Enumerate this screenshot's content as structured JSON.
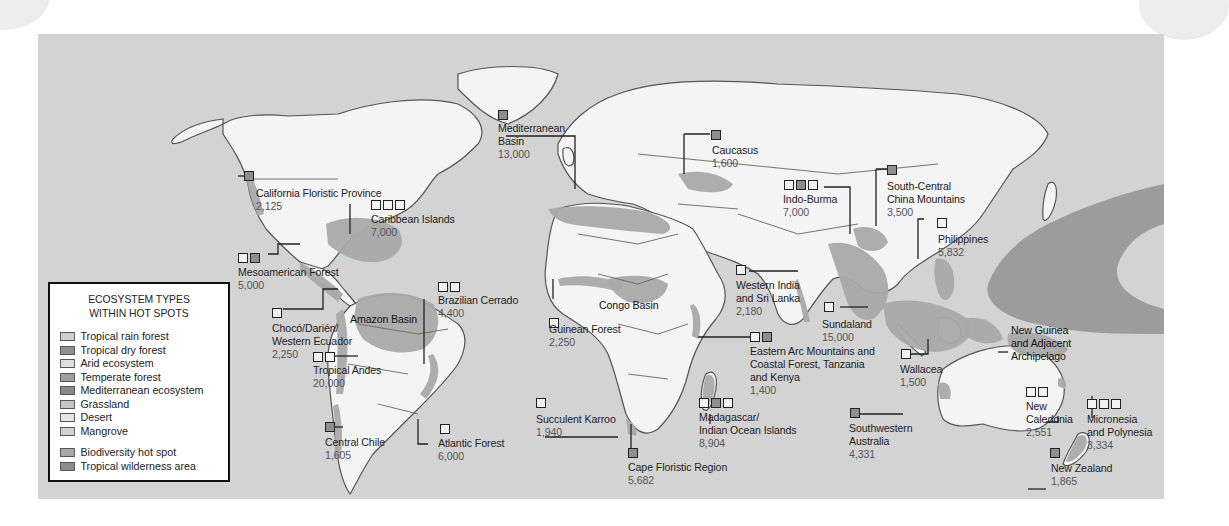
{
  "legend": {
    "title_line1": "ECOSYSTEM TYPES",
    "title_line2": "WITHIN HOT SPOTS",
    "ecosystem_types": [
      {
        "label": "Tropical rain forest",
        "color": "#cfcfcf"
      },
      {
        "label": "Tropical dry forest",
        "color": "#8f8f8f"
      },
      {
        "label": "Arid ecosystem",
        "color": "#dedede"
      },
      {
        "label": "Temperate forest",
        "color": "#a0a0a0"
      },
      {
        "label": "Mediterranean ecosystem",
        "color": "#8a8a8a"
      },
      {
        "label": "Grassland",
        "color": "#c6c6c6"
      },
      {
        "label": "Desert",
        "color": "#e6e6e6"
      },
      {
        "label": "Mangrove",
        "color": "#d2d2d2"
      }
    ],
    "area_types": [
      {
        "label": "Biodiversity hot spot",
        "color": "#a9a9a9"
      },
      {
        "label": "Tropical wilderness area",
        "color": "#8c8c8c"
      }
    ]
  },
  "colors": {
    "ocean": "#d3d3d3",
    "land": "#f4f4f4",
    "hot_spot": "#a9a9a9",
    "wilderness": "#9c9c9c",
    "outline": "#555555"
  },
  "hotspots": [
    {
      "id": "california",
      "name": "California Floristic Province",
      "value": "2,125"
    },
    {
      "id": "caribbean",
      "name": "Caribbean Islands",
      "value": "7,000"
    },
    {
      "id": "mesoamerica",
      "name": "Mesoamerican Forest",
      "value": "5,000"
    },
    {
      "id": "choco",
      "name_line1": "Chocó/Darién/",
      "name_line2": "Western Ecuador",
      "value": "2,250"
    },
    {
      "id": "amazon",
      "name": "Amazon Basin"
    },
    {
      "id": "cerrado",
      "name": "Brazilian Cerrado",
      "value": "4,400"
    },
    {
      "id": "andes",
      "name": "Tropical Andes",
      "value": "20,000"
    },
    {
      "id": "chile",
      "name": "Central Chile",
      "value": "1,605"
    },
    {
      "id": "atlantic",
      "name": "Atlantic Forest",
      "value": "6,000"
    },
    {
      "id": "mediterranean",
      "name_line1": "Mediterranean",
      "name_line2": "Basin",
      "value": "13,000"
    },
    {
      "id": "caucasus",
      "name": "Caucasus",
      "value": "1,600"
    },
    {
      "id": "guinean",
      "name": "Guinean Forest",
      "value": "2,250"
    },
    {
      "id": "congo",
      "name": "Congo Basin"
    },
    {
      "id": "karroo",
      "name": "Succulent Karroo",
      "value": "1,940"
    },
    {
      "id": "cape",
      "name": "Cape Floristic Region",
      "value": "5,682"
    },
    {
      "id": "madagascar",
      "name_line1": "Madagascar/",
      "name_line2": "Indian Ocean Islands",
      "value": "8,904"
    },
    {
      "id": "eastern_arc",
      "name_line1": "Eastern Arc Mountains and",
      "name_line2": "Coastal Forest, Tanzania",
      "name_line3": "and Kenya",
      "value": "1,400"
    },
    {
      "id": "western_india",
      "name_line1": "Western India",
      "name_line2": "and Sri Lanka",
      "value": "2,180"
    },
    {
      "id": "indo_burma",
      "name": "Indo-Burma",
      "value": "7,000"
    },
    {
      "id": "south_central_china",
      "name_line1": "South-Central",
      "name_line2": "China Mountains",
      "value": "3,500"
    },
    {
      "id": "philippines",
      "name": "Philippines",
      "value": "5,832"
    },
    {
      "id": "sundaland",
      "name": "Sundaland",
      "value": "15,000"
    },
    {
      "id": "wallacea",
      "name": "Wallacea",
      "value": "1,500"
    },
    {
      "id": "new_guinea",
      "name_line1": "New Guinea",
      "name_line2": "and Adjacent",
      "name_line3": "Archipelago"
    },
    {
      "id": "sw_australia",
      "name_line1": "Southwestern",
      "name_line2": "Australia",
      "value": "4,331"
    },
    {
      "id": "new_caledonia",
      "name_line1": "New",
      "name_line2": "Caledonia",
      "value": "2,551"
    },
    {
      "id": "micronesia",
      "name_line1": "Micronesia",
      "name_line2": "and Polynesia",
      "value": "3,334"
    },
    {
      "id": "new_zealand",
      "name": "New Zealand",
      "value": "1,865"
    }
  ]
}
